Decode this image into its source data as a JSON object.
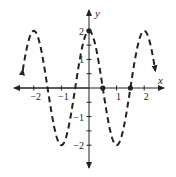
{
  "chart_data": {
    "type": "line",
    "title": "",
    "xlabel": "x",
    "ylabel": "y",
    "function": "y = 2cos(pi x)",
    "xlim": [
      -2.4,
      2.4
    ],
    "ylim": [
      -2.6,
      2.6
    ],
    "grid": false,
    "legend": null,
    "line_style": "dashed",
    "x_ticks": [
      -2,
      -1,
      1,
      2
    ],
    "x_tick_labels": [
      "−2",
      "−1",
      "1",
      "2"
    ],
    "y_ticks": [
      -2,
      -1,
      1,
      2
    ],
    "y_tick_labels": [
      "−2",
      "−1",
      "1",
      "2"
    ],
    "y_minor_ticks": [
      -1.5,
      -0.5,
      0.5,
      1.5
    ],
    "series": [
      {
        "name": "curve",
        "x": [
          -2.4,
          -2,
          -1.5,
          -1,
          -0.5,
          0,
          0.5,
          1,
          1.5,
          2,
          2.4
        ],
        "values": [
          0.62,
          2,
          0,
          -2,
          0,
          2,
          0,
          -2,
          0,
          2,
          0.62
        ]
      }
    ],
    "marked_points": [
      {
        "x": 0,
        "y": 2
      },
      {
        "x": 0.5,
        "y": 0
      },
      {
        "x": 1.5,
        "y": 0
      }
    ],
    "annotations": [
      "arrows at both ends of curve",
      "arrows at both ends of axes"
    ]
  }
}
